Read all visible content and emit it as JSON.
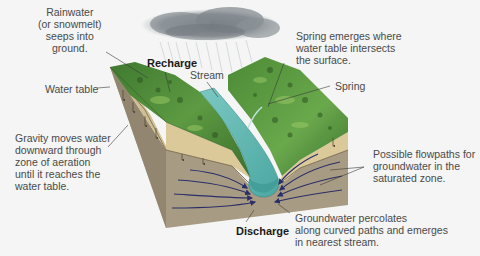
{
  "diagram": {
    "type": "groundwater-block-diagram",
    "colors": {
      "background": "#f4f5f4",
      "vegetation": "#4e8a3a",
      "vegetation_dark": "#2f5e25",
      "vegetation_light": "#8fbf5a",
      "stream": "#5fb8b4",
      "stream_dark": "#3c9692",
      "aeration_zone": "#d9c89a",
      "saturated_zone": "#a89b83",
      "side_face": "#9a8d76",
      "flow_arrows": "#2a2f6a",
      "cloud": "#8f969b",
      "label_text": "#4a4a4a"
    },
    "icons": [
      "rain-cloud-icon",
      "downward-arrow-icon",
      "flowpath-arrow-icon"
    ]
  },
  "labels": {
    "rainwater": "Rainwater\n(or snowmelt)\nseeps into\nground.",
    "recharge": "Recharge",
    "stream": "Stream",
    "water_table": "Water table",
    "gravity": "Gravity moves water\ndownward through\nzone of aeration\nuntil it reaches the\nwater table.",
    "spring_emerges": "Spring emerges where\nwater table intersects\nthe surface.",
    "spring": "Spring",
    "flowpaths": "Possible flowpaths for\ngroundwater in the\nsaturated zone.",
    "discharge": "Discharge",
    "percolates": "Groundwater percolates\nalong curved paths and emerges\nin nearest stream."
  }
}
